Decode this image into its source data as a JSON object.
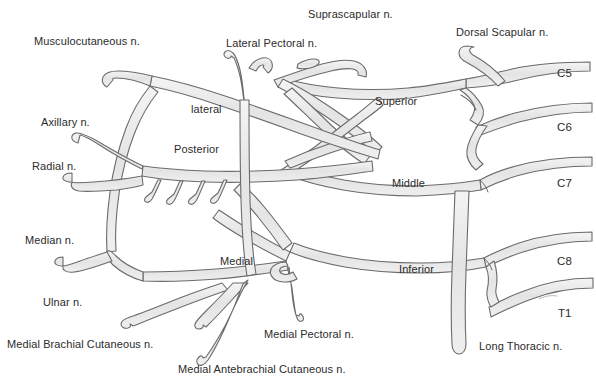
{
  "figure": {
    "background_color": "#ffffff",
    "nerve_fill_color": "#e9e9e9",
    "nerve_stroke_color": "#6b6b6b",
    "text_color": "#2b2b2b"
  },
  "labels": {
    "terminal_branches": [
      {
        "id": "musculocutaneous",
        "text": "Musculocutaneous n.",
        "x": 34,
        "y": 36
      },
      {
        "id": "axillary",
        "text": "Axillary n.",
        "x": 41,
        "y": 117
      },
      {
        "id": "radial",
        "text": "Radial n.",
        "x": 32,
        "y": 161
      },
      {
        "id": "median",
        "text": "Median n.",
        "x": 25,
        "y": 235
      },
      {
        "id": "ulnar",
        "text": "Ulnar n.",
        "x": 43,
        "y": 297
      },
      {
        "id": "medial-brachial-cutaneous",
        "text": "Medial Brachial Cutaneous n.",
        "x": 7,
        "y": 339
      },
      {
        "id": "medial-antebrachial-cutaneous",
        "text": "Medial Antebrachial Cutaneous n.",
        "x": 178,
        "y": 364
      },
      {
        "id": "medial-pectoral",
        "text": "Medial Pectoral n.",
        "x": 264,
        "y": 329
      },
      {
        "id": "lateral-pectoral",
        "text": "Lateral Pectoral n.",
        "x": 226,
        "y": 38
      },
      {
        "id": "suprascapular",
        "text": "Suprascapular n.",
        "x": 308,
        "y": 9
      },
      {
        "id": "dorsal-scapular",
        "text": "Dorsal Scapular n.",
        "x": 456,
        "y": 27
      },
      {
        "id": "long-thoracic",
        "text": "Long Thoracic n.",
        "x": 479,
        "y": 341
      }
    ],
    "cords": [
      {
        "id": "lateral-cord",
        "text": "lateral",
        "x": 191,
        "y": 104
      },
      {
        "id": "posterior-cord",
        "text": "Posterior",
        "x": 174,
        "y": 144
      },
      {
        "id": "medial-cord",
        "text": "Medial",
        "x": 220,
        "y": 256
      }
    ],
    "trunks": [
      {
        "id": "superior-trunk",
        "text": "Superior",
        "x": 375,
        "y": 96
      },
      {
        "id": "middle-trunk",
        "text": "Middle",
        "x": 392,
        "y": 178
      },
      {
        "id": "inferior-trunk",
        "text": "Inferior",
        "x": 399,
        "y": 264
      }
    ],
    "roots": [
      {
        "id": "root-c5",
        "text": "C5",
        "x": 557,
        "y": 68
      },
      {
        "id": "root-c6",
        "text": "C6",
        "x": 557,
        "y": 122
      },
      {
        "id": "root-c7",
        "text": "C7",
        "x": 557,
        "y": 178
      },
      {
        "id": "root-c8",
        "text": "C8",
        "x": 557,
        "y": 256
      },
      {
        "id": "root-t1",
        "text": "T1",
        "x": 558,
        "y": 308
      }
    ]
  }
}
